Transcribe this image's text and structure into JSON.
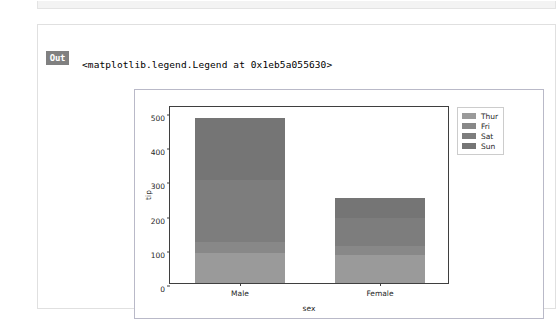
{
  "notebook": {
    "out_prompt": "Out",
    "repr_text": "<matplotlib.legend.Legend at 0x1eb5a055630>"
  },
  "chart_data": {
    "type": "bar",
    "subtype": "stacked-bar",
    "title": "",
    "xlabel": "sex",
    "ylabel": "tip",
    "categories": [
      "Male",
      "Female"
    ],
    "ylim": [
      0,
      520
    ],
    "yticks": [
      0,
      100,
      200,
      300,
      400,
      500
    ],
    "ytick_labels": [
      "0",
      "100",
      "200",
      "300",
      "400",
      "500"
    ],
    "grid": false,
    "legend_position": "upper right (outside axes)",
    "series": [
      {
        "name": "Thur",
        "values": [
          89,
          82
        ],
        "color": "#9a9a9a"
      },
      {
        "name": "Fri",
        "values": [
          30,
          26
        ],
        "color": "#888888"
      },
      {
        "name": "Sat",
        "values": [
          181,
          82
        ],
        "color": "#7d7d7d"
      },
      {
        "name": "Sun",
        "values": [
          183,
          57
        ],
        "color": "#757575"
      }
    ],
    "totals": [
      483,
      247
    ]
  },
  "colors": {
    "figure_border": "#b9b9c8",
    "axes_spine": "#3f3f3f",
    "text": "#262626",
    "prompt_bg": "#808080",
    "cell_border": "#e0e0e0"
  }
}
